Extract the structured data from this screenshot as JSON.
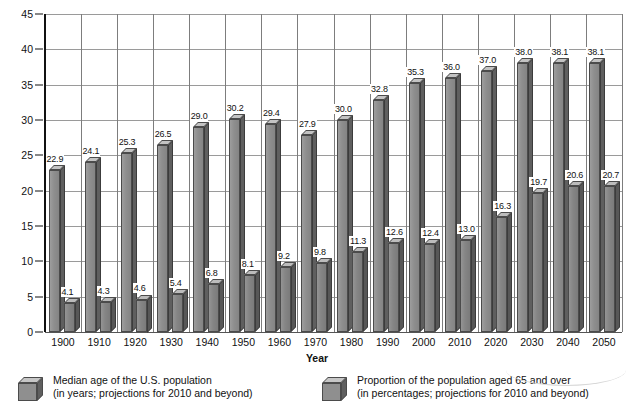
{
  "chart_data": {
    "type": "bar",
    "title": "",
    "xlabel": "Year",
    "ylabel": "",
    "ylim": [
      0,
      45
    ],
    "ytick_step": 5,
    "yticks": [
      "45",
      "40",
      "35",
      "30",
      "25",
      "20",
      "15",
      "10",
      "5",
      "0"
    ],
    "grid": true,
    "legend_position": "bottom",
    "categories": [
      "1900",
      "1910",
      "1920",
      "1930",
      "1940",
      "1950",
      "1960",
      "1970",
      "1980",
      "1990",
      "2000",
      "2010",
      "2020",
      "2030",
      "2040",
      "2050"
    ],
    "series": [
      {
        "name": "Median age of the U.S. population",
        "name_line2": "(in years; projections for 2010 and beyond)",
        "values": [
          22.9,
          24.1,
          25.3,
          26.5,
          29.0,
          30.2,
          29.4,
          27.9,
          30.0,
          32.8,
          35.3,
          36.0,
          37.0,
          38.0,
          38.1,
          38.1
        ],
        "labels": [
          "22.9",
          "24.1",
          "25.3",
          "26.5",
          "29.0",
          "30.2",
          "29.4",
          "27.9",
          "30.0",
          "32.8",
          "35.3",
          "36.0",
          "37.0",
          "38.0",
          "38.1",
          "38.1"
        ]
      },
      {
        "name": "Proportion of the population aged 65 and over",
        "name_line2": "(in percentages; projections for 2010 and beyond)",
        "values": [
          4.1,
          4.3,
          4.6,
          5.4,
          6.8,
          8.1,
          9.2,
          9.8,
          11.3,
          12.6,
          12.4,
          13.0,
          16.3,
          19.7,
          20.6,
          20.7
        ],
        "labels": [
          "4.1",
          "4.3",
          "4.6",
          "5.4",
          "6.8",
          "8.1",
          "9.2",
          "9.8",
          "11.3",
          "12.6",
          "12.4",
          "13.0",
          "16.3",
          "19.7",
          "20.6",
          "20.7"
        ]
      }
    ]
  },
  "legend": {
    "items": [
      {
        "line1": "Median age of the U.S. population",
        "line2": "(in years; projections for 2010 and beyond)"
      },
      {
        "line1": "Proportion of the population aged 65 and over",
        "line2": "(in percentages; projections for 2010 and beyond)"
      }
    ]
  },
  "axis": {
    "x_title": "Year"
  },
  "colors": {
    "bar_front": "#8e8e8e",
    "bar_top": "#c3c3c3",
    "bar_side": "#5f5f5f",
    "grid": "#9a9a9a",
    "axis": "#111111",
    "background": "#ffffff"
  }
}
